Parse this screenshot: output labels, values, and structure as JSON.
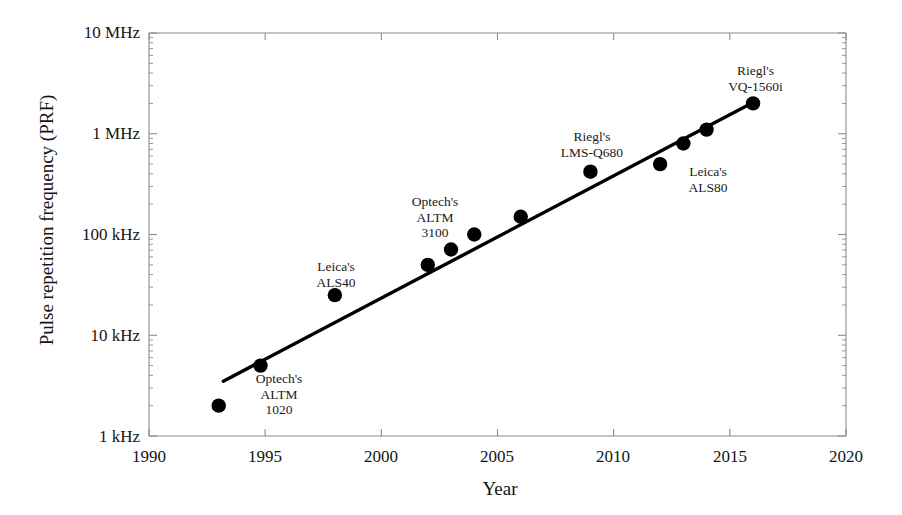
{
  "chart_data": {
    "type": "scatter",
    "title": "",
    "xlabel": "Year",
    "ylabel": "Pulse repetition frequency (PRF)",
    "xlim": [
      1990,
      2020
    ],
    "ylim": [
      1000,
      10000000
    ],
    "yscale": "log",
    "grid": false,
    "legend": "none",
    "xticks": [
      1990,
      1995,
      2000,
      2005,
      2010,
      2015,
      2020
    ],
    "xticklabels": [
      "1990",
      "1995",
      "2000",
      "2005",
      "2010",
      "2015",
      "2020"
    ],
    "yticks": [
      1000,
      10000,
      100000,
      1000000,
      10000000
    ],
    "yticklabels": [
      "1 kHz",
      "10 kHz",
      "100 kHz",
      "1 MHz",
      "10 MHz"
    ],
    "yunits": [
      "Hz"
    ],
    "points": [
      {
        "x": 1993.0,
        "y": 2000,
        "y_display": "2 kHz",
        "label": ""
      },
      {
        "x": 1994.8,
        "y": 5000,
        "y_display": "5 kHz",
        "label": "Optech's ALTM 1020"
      },
      {
        "x": 1998.0,
        "y": 25000,
        "y_display": "25 kHz",
        "label": "Leica's ALS40"
      },
      {
        "x": 2002.0,
        "y": 50000,
        "y_display": "50 kHz",
        "label": ""
      },
      {
        "x": 2003.0,
        "y": 71000,
        "y_display": "71 kHz",
        "label": "Optech's ALTM 3100"
      },
      {
        "x": 2004.0,
        "y": 100000,
        "y_display": "100 kHz",
        "label": ""
      },
      {
        "x": 2006.0,
        "y": 150000,
        "y_display": "150 kHz",
        "label": ""
      },
      {
        "x": 2009.0,
        "y": 420000,
        "y_display": "420 kHz",
        "label": "Riegl's LMS-Q680"
      },
      {
        "x": 2012.0,
        "y": 500000,
        "y_display": "500 kHz",
        "label": "Leica's ALS80"
      },
      {
        "x": 2013.0,
        "y": 800000,
        "y_display": "800 kHz",
        "label": ""
      },
      {
        "x": 2014.0,
        "y": 1100000,
        "y_display": "1.1 MHz",
        "label": ""
      },
      {
        "x": 2016.0,
        "y": 2000000,
        "y_display": "2 MHz",
        "label": "Riegl's VQ-1560i"
      }
    ],
    "trendline": {
      "type": "line",
      "x": [
        1993.2,
        2016.1
      ],
      "y": [
        3500,
        2100000
      ],
      "style": "solid",
      "color": "#000000"
    },
    "annotations": [
      {
        "text_lines": [
          "Optech's",
          "ALTM",
          "1020"
        ],
        "near_point_index": 1
      },
      {
        "text_lines": [
          "Leica's",
          "ALS40"
        ],
        "near_point_index": 2
      },
      {
        "text_lines": [
          "Optech's",
          "ALTM",
          "3100"
        ],
        "near_point_index": 4
      },
      {
        "text_lines": [
          "Riegl's",
          "LMS-Q680"
        ],
        "near_point_index": 7
      },
      {
        "text_lines": [
          "Leica's",
          "ALS80"
        ],
        "near_point_index": 8
      },
      {
        "text_lines": [
          "Riegl's",
          "VQ-1560i"
        ],
        "near_point_index": 11
      }
    ],
    "colors": {
      "marker": "#000000",
      "trendline": "#000000",
      "axis": "#8c8c8c",
      "text": "#141414",
      "background": "#ffffff"
    }
  },
  "axes": {
    "y_title": "Pulse repetition frequency (PRF)",
    "x_title": "Year",
    "y_tick_labels": [
      "10 MHz",
      "1 MHz",
      "100 kHz",
      "10 kHz",
      "1 kHz"
    ],
    "x_tick_labels": [
      "1990",
      "1995",
      "2000",
      "2005",
      "2010",
      "2015",
      "2020"
    ]
  },
  "annotation_text": {
    "a0_l0": "Optech's",
    "a0_l1": "ALTM",
    "a0_l2": "1020",
    "a1_l0": "Leica's",
    "a1_l1": "ALS40",
    "a2_l0": "Optech's",
    "a2_l1": "ALTM",
    "a2_l2": "3100",
    "a3_l0": "Riegl's",
    "a3_l1": "LMS-Q680",
    "a4_l0": "Leica's",
    "a4_l1": "ALS80",
    "a5_l0": "Riegl's",
    "a5_l1": "VQ-1560i"
  }
}
